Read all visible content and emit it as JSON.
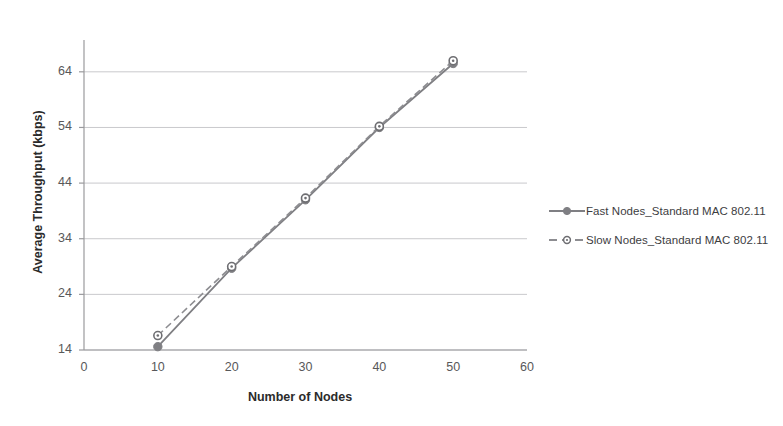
{
  "figure": {
    "top_partial_text": "",
    "background": "#ffffff",
    "series_color": "#7f7f83"
  },
  "chart_data": {
    "type": "line",
    "title": "",
    "xlabel": "Number of Nodes",
    "ylabel": "Average Throughput (kbps)",
    "xlim": [
      0,
      60
    ],
    "ylim": [
      14,
      69
    ],
    "xticks": [
      0,
      10,
      20,
      30,
      40,
      50,
      60
    ],
    "yticks": [
      14,
      24,
      34,
      44,
      54,
      64
    ],
    "grid": "horizontal",
    "legend_position": "right",
    "series": [
      {
        "name": "Fast Nodes_Standard MAC 802.11",
        "style": "solid",
        "marker": "filled-circle",
        "color": "#7f7f83",
        "x": [
          10,
          20,
          30,
          40,
          50
        ],
        "values": [
          14.6,
          28.7,
          41.0,
          54.0,
          65.5
        ]
      },
      {
        "name": "Slow Nodes_Standard MAC 802.11",
        "style": "dashed",
        "marker": "hollow-circle",
        "color": "#8d8d91",
        "x": [
          10,
          20,
          30,
          40,
          50
        ],
        "values": [
          16.6,
          29.0,
          41.3,
          54.2,
          66.0
        ]
      }
    ]
  },
  "legend": {
    "items": [
      {
        "label": "Fast Nodes_Standard MAC 802.11"
      },
      {
        "label": "Slow Nodes_Standard MAC 802.11"
      }
    ]
  }
}
